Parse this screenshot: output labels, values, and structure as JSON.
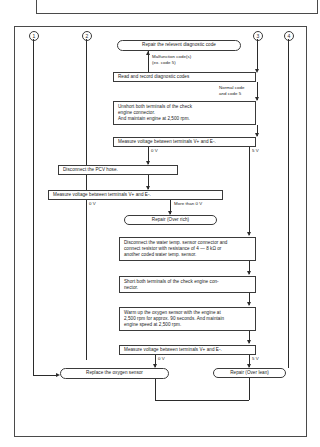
{
  "diagram": {
    "refs": [
      {
        "label": "1"
      },
      {
        "label": "2"
      },
      {
        "label": "3"
      },
      {
        "label": "4"
      }
    ],
    "nodes": {
      "repair_relevant": "Repair the relevent diagnostic code",
      "read_record": "Read and record diagnostic codes",
      "unshort": "Unshort both terminals of the check\nengine connector.\nAnd maintain engine at 2,500 rpm.",
      "measure1": "Measure voltage between terminals V+ and E-.",
      "disconnect_pcv": "Disconnect the PCV hose.",
      "measure2": "Measure voltage between terminals V+ and E-.",
      "repair_over_rich": "Repair (Over rich)",
      "disconnect_water_temp": "Disconnect the water temp. sensor connector and\nconnect resistor with resistance of 4 — 8 kΩ or\nanother coded water temp. sensor.",
      "short_terminals": "Short both terminals of the check engine con-\nnector.",
      "warm_up": "Warm up the oxygen sensor with the engine at\n2,500 rpm for approx. 90 seconds. And maintain\nengine speed at 2,500 rpm.",
      "measure3": "Measure voltage between terminals V+ and E-.",
      "replace_oxygen": "Replace the oxygen sensor",
      "repair_over_lean": "Repair (Over lean)"
    },
    "edge_labels": {
      "malfunction": "Malfunction code(s)\n(ex. code 5)",
      "normal": "Normal code\nand code 5",
      "m1_zero": "0 V",
      "m1_five": "5 V",
      "m2_zero": "0 V",
      "m2_more": "More than 0 V",
      "m3_zero": "0 V",
      "m3_five": "5 V"
    }
  }
}
